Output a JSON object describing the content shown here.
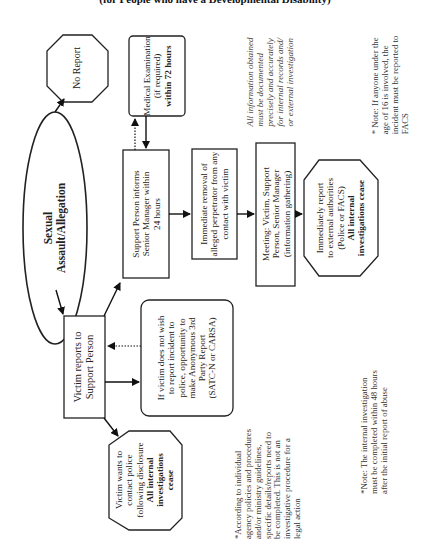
{
  "header": {
    "title": "(for People who have a Developmental Disability)"
  },
  "nodes": {
    "start": {
      "line1": "Sexual",
      "line2": "Assault/Allegation"
    },
    "no_report": {
      "label": "No Report"
    },
    "victim_reports": {
      "line1": "Victim reports to",
      "line2": "Support Person"
    },
    "support_informs": {
      "line1": "Support Person informs",
      "line2": "Senior Manager within",
      "line3": "24 hours"
    },
    "medical": {
      "line1": "Medical Examination",
      "line2": "(if required)",
      "line3": "within 72 hours"
    },
    "removal": {
      "line1": "Immediate removal of",
      "line2": "alleged perpetrator from any",
      "line3": "contact with victim"
    },
    "meeting": {
      "line1": "Meeting: Victim, Support",
      "line2": "Person, Senior Manager",
      "line3": "(information gathering)"
    },
    "external_report": {
      "line1": "Immediately report",
      "line2": "to external authorities",
      "line3": "(Police or FACS)",
      "line4": "All internal",
      "line5": "investigations cease"
    },
    "anonymous": {
      "line1": "If victim does not wish",
      "line2": "to report incident to",
      "line3": "police, opportunity to",
      "line4": "make Anonymous 3rd",
      "line5": "Party Report",
      "line6": "(SATC-N or CARSA)"
    },
    "contact_police": {
      "line1": "Victim wants to",
      "line2": "contact police",
      "line3": "following disclosure",
      "line4": "All internal",
      "line5": "investigations",
      "line6": "cease"
    }
  },
  "notes": {
    "documentation": {
      "line1": "All information obtained",
      "line2": "must be documented",
      "line3": "precisely and accurately",
      "line4": "for internal records and/",
      "line5": "or external investigation"
    },
    "under16": {
      "line1": "* Note:  If anyone under the",
      "line2": "age of 16 is involved, the",
      "line3": "incident must be reported to",
      "line4": "FACS"
    },
    "agency": {
      "line1": "*According to individual",
      "line2": "agency policies and procedures",
      "line3": "and/or ministry guidelines,",
      "line4": "specific details/reports need to",
      "line5": "be completed.  This is not an",
      "line6": "investigative procedure for a",
      "line7": "legal action"
    },
    "timeline": {
      "line1": "*Note:  The internal investigation",
      "line2": "must be completed within 48 hours",
      "line3": "after the initial report of abuse"
    }
  }
}
